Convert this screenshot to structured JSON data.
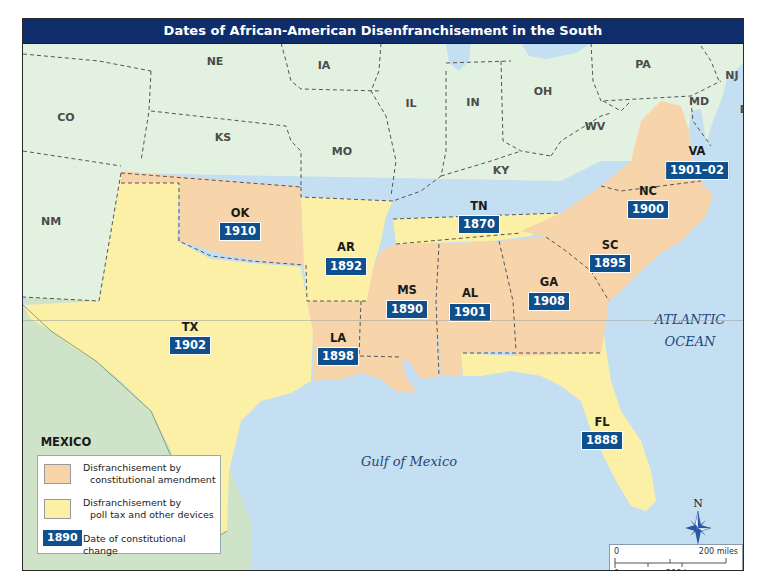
{
  "map": {
    "title": "Dates of African-American Disenfranchisement in the South",
    "colors": {
      "constitutional_amendment": "#f8d4aa",
      "poll_tax": "#fbf0a6",
      "other_states": "#e3f1e1",
      "mexico": "#cfe3c8",
      "water": "#c5dff2",
      "date_badge": "#0f4f8c",
      "title_bar": "#0f2d6b"
    },
    "states_disenfranchised": [
      {
        "abbr": "VA",
        "date": "1901–02",
        "type": "constitutional_amendment"
      },
      {
        "abbr": "NC",
        "date": "1900",
        "type": "constitutional_amendment"
      },
      {
        "abbr": "OK",
        "date": "1910",
        "type": "constitutional_amendment"
      },
      {
        "abbr": "TN",
        "date": "1870",
        "type": "poll_tax"
      },
      {
        "abbr": "AR",
        "date": "1892",
        "type": "poll_tax"
      },
      {
        "abbr": "SC",
        "date": "1895",
        "type": "constitutional_amendment"
      },
      {
        "abbr": "MS",
        "date": "1890",
        "type": "constitutional_amendment"
      },
      {
        "abbr": "AL",
        "date": "1901",
        "type": "constitutional_amendment"
      },
      {
        "abbr": "GA",
        "date": "1908",
        "type": "constitutional_amendment"
      },
      {
        "abbr": "TX",
        "date": "1902",
        "type": "poll_tax"
      },
      {
        "abbr": "LA",
        "date": "1898",
        "type": "constitutional_amendment"
      },
      {
        "abbr": "FL",
        "date": "1888",
        "type": "poll_tax"
      }
    ],
    "other_states": [
      "NE",
      "IA",
      "PA",
      "NJ",
      "CO",
      "IL",
      "IN",
      "OH",
      "MD",
      "DE",
      "KS",
      "WV",
      "MO",
      "KY",
      "NM"
    ],
    "other_labels": {
      "mexico": "MEXICO",
      "atlantic_line1": "ATLANTIC",
      "atlantic_line2": "OCEAN",
      "gulf": "Gulf of Mexico"
    },
    "legend": {
      "item1_line1": "Disfranchisement by",
      "item1_line2": "constitutional amendment",
      "item2_line1": "Disfranchisement by",
      "item2_line2": "poll tax and other devices",
      "badge_sample": "1890",
      "item3": "Date of constitutional change"
    },
    "scale": {
      "zero_top": "0",
      "miles": "200 miles",
      "zero_bottom": "0",
      "km": "200 km"
    },
    "compass": {
      "north": "N"
    }
  }
}
